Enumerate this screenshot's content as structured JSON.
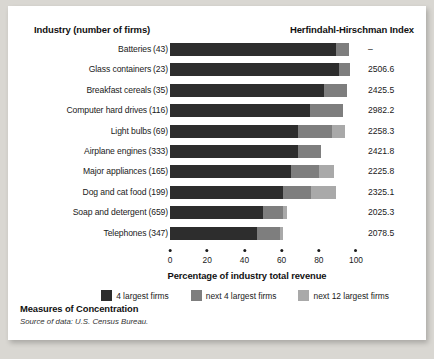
{
  "figure": {
    "header_industry": "Industry (number of firms)",
    "header_hhi": "Herfindahl-Hirschman Index",
    "footer_title": "Measures of Concentration",
    "footer_source": "Source of data: U.S. Census Bureau."
  },
  "colors": {
    "series1": "#2d2d2d",
    "series2": "#7e7e7e",
    "series3": "#a9a9a9",
    "panel": "#ffffff",
    "page": "#d9d7d2",
    "text": "#1a1a1a"
  },
  "chart_data": {
    "type": "bar",
    "orientation": "horizontal",
    "stacked": true,
    "title": "Measures of Concentration",
    "xlabel": "Percentage of industry total revenue",
    "ylabel": "Industry (number of firms)",
    "xlim": [
      0,
      100
    ],
    "xticks": [
      0,
      20,
      40,
      60,
      80,
      100
    ],
    "xticklabels": [
      "0",
      "20",
      "40",
      "60",
      "80",
      "100"
    ],
    "grid": false,
    "legend_position": "bottom",
    "legend": [
      "4 largest firms",
      "next 4 largest firms",
      "next 12 largest firms"
    ],
    "categories": [
      "Batteries",
      "Glass containers",
      "Breakfast cereals",
      "Computer hard drives",
      "Light bulbs",
      "Airplane engines",
      "Major appliances",
      "Dog and cat food",
      "Soap and detergent",
      "Telephones"
    ],
    "firm_counts": [
      43,
      23,
      35,
      116,
      69,
      333,
      165,
      199,
      347,
      659
    ],
    "series": [
      {
        "name": "4 largest firms",
        "color": "#2d2d2d",
        "values": [
          89,
          91,
          83,
          75,
          69,
          69,
          65,
          61,
          50,
          47
        ]
      },
      {
        "name": "next 4 largest firms",
        "color": "#7e7e7e",
        "values": [
          7,
          6,
          12,
          18,
          18,
          12,
          15,
          15,
          11,
          12
        ]
      },
      {
        "name": "next 12 largest firms",
        "color": "#a9a9a9",
        "values": [
          0,
          0,
          0,
          0,
          7,
          0,
          8,
          13,
          2,
          2
        ]
      }
    ],
    "rows": [
      {
        "label": "Batteries",
        "firms": "(43)",
        "s1": 89,
        "s2": 7,
        "s3": 0,
        "hhi": "–"
      },
      {
        "label": "Glass containers",
        "firms": "(23)",
        "s1": 91,
        "s2": 6,
        "s3": 0,
        "hhi": "2506.6"
      },
      {
        "label": "Breakfast cereals",
        "firms": "(35)",
        "s1": 83,
        "s2": 12,
        "s3": 0,
        "hhi": "2425.5"
      },
      {
        "label": "Computer hard drives",
        "firms": "(116)",
        "s1": 75,
        "s2": 18,
        "s3": 0,
        "hhi": "2982.2"
      },
      {
        "label": "Light bulbs",
        "firms": "(69)",
        "s1": 69,
        "s2": 18,
        "s3": 7,
        "hhi": "2258.3"
      },
      {
        "label": "Airplane engines",
        "firms": "(333)",
        "s1": 69,
        "s2": 12,
        "s3": 0,
        "hhi": "2421.8"
      },
      {
        "label": "Major appliances",
        "firms": "(165)",
        "s1": 65,
        "s2": 15,
        "s3": 8,
        "hhi": "2225.8"
      },
      {
        "label": "Dog and cat food",
        "firms": "(199)",
        "s1": 61,
        "s2": 15,
        "s3": 13,
        "hhi": "2325.1"
      },
      {
        "label": "Soap and detergent",
        "firms": "(659)",
        "s1": 50,
        "s2": 11,
        "s3": 2,
        "hhi": "2025.3"
      },
      {
        "label": "Telephones",
        "firms": "(347)",
        "s1": 47,
        "s2": 12,
        "s3": 2,
        "hhi": "2078.5"
      }
    ]
  }
}
